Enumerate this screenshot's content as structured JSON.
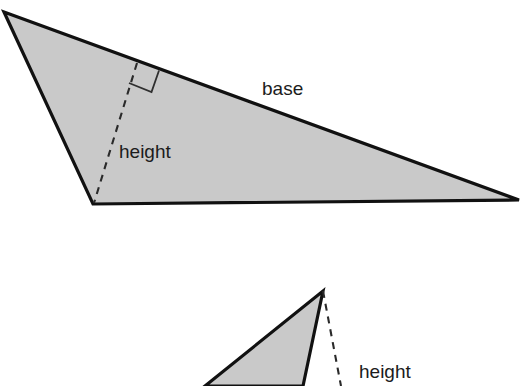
{
  "figure": {
    "background_color": "#ffffff",
    "fill_color": "#c9c9c9",
    "stroke_color": "#111111",
    "label_color": "#1c1c1c",
    "dash_color": "#2a2a2a"
  },
  "shapes": {
    "triangle_top": {
      "name": "obtuse-triangle",
      "points": "4,12 519,200 93,204",
      "vertices": [
        {
          "x": 4,
          "y": 12
        },
        {
          "x": 519,
          "y": 200
        },
        {
          "x": 93,
          "y": 204
        }
      ],
      "base_edge": {
        "from": {
          "x": 4,
          "y": 12
        },
        "to": {
          "x": 519,
          "y": 200
        }
      },
      "height_line": {
        "from": {
          "x": 137,
          "y": 63
        },
        "to": {
          "x": 94,
          "y": 203
        }
      },
      "right_angle_marker": "137,63 160,71 152,92 130,84"
    },
    "triangle_bottom": {
      "name": "narrow-triangle",
      "points": "323,291 303,386 205,386",
      "vertices": [
        {
          "x": 323,
          "y": 291
        },
        {
          "x": 303,
          "y": 386
        },
        {
          "x": 205,
          "y": 386
        }
      ],
      "height_line": {
        "from": {
          "x": 323,
          "y": 291
        },
        "to": {
          "x": 341,
          "y": 386
        }
      }
    }
  },
  "labels": {
    "base_top": {
      "text": "base",
      "x": 262,
      "y": 95
    },
    "height_top": {
      "text": "height",
      "x": 119,
      "y": 158
    },
    "height_bottom": {
      "text": "height",
      "x": 359,
      "y": 378
    }
  }
}
